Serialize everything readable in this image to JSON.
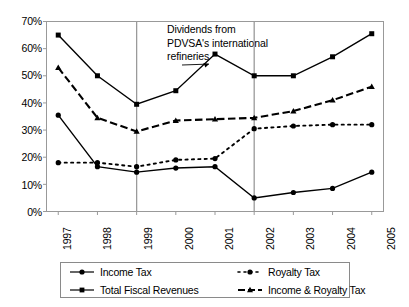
{
  "chart_data": {
    "type": "line",
    "title": "",
    "xlabel": "",
    "ylabel": "",
    "categories": [
      "1997",
      "1998",
      "1999",
      "2000",
      "2001",
      "2002",
      "2003",
      "2004",
      "2005"
    ],
    "x": [
      1997,
      1998,
      1999,
      2000,
      2001,
      2002,
      2003,
      2004,
      2005
    ],
    "ylim": [
      0,
      70
    ],
    "xlim": [
      1997,
      2005
    ],
    "yticks": [
      0,
      10,
      20,
      30,
      40,
      50,
      60,
      70
    ],
    "ytick_labels": [
      "0%",
      "10%",
      "20%",
      "30%",
      "40%",
      "50%",
      "60%",
      "70%"
    ],
    "grid": false,
    "legend_position": "bottom",
    "series": [
      {
        "name": "Income Tax",
        "marker": "circle",
        "line_style": "solid",
        "color": "#000000",
        "values": [
          35.5,
          16.5,
          14.5,
          16.0,
          16.5,
          5.0,
          7.0,
          8.5,
          14.5
        ]
      },
      {
        "name": "Royalty Tax",
        "marker": "circle",
        "line_style": "dotted",
        "color": "#000000",
        "values": [
          18.0,
          18.0,
          16.5,
          19.0,
          19.5,
          30.5,
          31.5,
          32.0,
          32.0
        ]
      },
      {
        "name": "Total Fiscal Revenues",
        "marker": "square",
        "line_style": "solid",
        "color": "#000000",
        "values": [
          65.0,
          50.0,
          39.5,
          44.5,
          58.0,
          50.0,
          50.0,
          57.0,
          65.5
        ]
      },
      {
        "name": "Income & Royalty Tax",
        "marker": "triangle",
        "line_style": "dashed",
        "color": "#000000",
        "values": [
          53.0,
          34.5,
          29.5,
          33.5,
          34.0,
          34.5,
          37.0,
          41.0,
          46.0
        ]
      }
    ],
    "vertical_markers": [
      {
        "at": 1999,
        "color": "#9a9a9a"
      },
      {
        "at": 2002,
        "color": "#9a9a9a"
      }
    ],
    "annotations": [
      {
        "text": "Dividends from\nPDVSA's  international\nrefineries",
        "points_to_x": 2001,
        "points_to_y": 58.0
      }
    ]
  },
  "legend": {
    "items": [
      {
        "label": "Income Tax",
        "marker": "circle",
        "line_style": "solid"
      },
      {
        "label": "Royalty Tax",
        "marker": "circle",
        "line_style": "dotted"
      },
      {
        "label": "Total Fiscal Revenues",
        "marker": "square",
        "line_style": "solid"
      },
      {
        "label": "Income & Royalty Tax",
        "marker": "triangle",
        "line_style": "dashed"
      }
    ]
  }
}
